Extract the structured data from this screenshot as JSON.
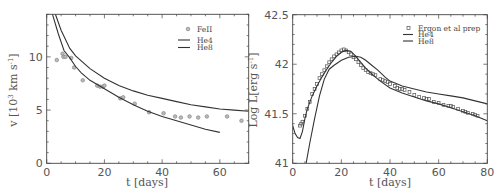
{
  "chart_data": [
    {
      "type": "line",
      "panel": "left",
      "title": "",
      "xlabel": "t [days]",
      "ylabel": "v [10^3 km s^-1]",
      "xlim": [
        0,
        70
      ],
      "ylim": [
        0,
        14
      ],
      "xticks": [
        0,
        20,
        40,
        60
      ],
      "yticks": [
        0,
        5,
        10
      ],
      "grid": false,
      "legend_position": "upper right",
      "legend": [
        "FeII",
        "He4",
        "He8"
      ],
      "series": [
        {
          "name": "FeII",
          "kind": "scatter",
          "x": [
            3.5,
            5.5,
            5.8,
            6.5,
            8.5,
            9.5,
            12.5,
            17.5,
            18.5,
            19.5,
            20,
            25.5,
            26.5,
            30.5,
            35.5,
            40.5,
            44.5,
            46.5,
            49.5,
            52.5,
            55.5,
            62.5,
            67.5
          ],
          "y": [
            9.7,
            10.3,
            10.0,
            10.0,
            9.9,
            9.0,
            7.8,
            7.3,
            7.2,
            7.2,
            7.3,
            6.1,
            6.2,
            5.6,
            4.8,
            4.7,
            4.4,
            4.3,
            4.4,
            4.3,
            4.4,
            4.4,
            4.0
          ]
        },
        {
          "name": "He4",
          "kind": "line",
          "x": [
            2,
            4,
            6,
            8,
            10,
            12,
            15,
            20,
            25,
            30,
            35,
            40,
            45,
            50,
            55,
            60
          ],
          "y": [
            14,
            12.2,
            10.6,
            9.9,
            9.1,
            8.5,
            7.8,
            7.0,
            6.2,
            5.5,
            4.9,
            4.4,
            4.0,
            3.6,
            3.2,
            2.9
          ]
        },
        {
          "name": "He8",
          "kind": "line",
          "x": [
            3,
            5,
            8,
            10,
            15,
            20,
            25,
            30,
            35,
            40,
            45,
            50,
            55,
            60,
            65,
            70
          ],
          "y": [
            14,
            12.5,
            10.8,
            10.1,
            8.9,
            8.0,
            7.3,
            6.8,
            6.4,
            6.1,
            5.8,
            5.5,
            5.3,
            5.1,
            5.0,
            4.9
          ]
        }
      ]
    },
    {
      "type": "line",
      "panel": "right",
      "title": "",
      "xlabel": "t [days]",
      "ylabel": "Log L[erg s^-1]",
      "xlim": [
        0,
        80
      ],
      "ylim": [
        41,
        42.5
      ],
      "xticks": [
        0,
        20,
        40,
        60,
        80
      ],
      "yticks": [
        41,
        41.5,
        42,
        42.5
      ],
      "grid": false,
      "legend_position": "upper right",
      "legend": [
        "Ergon et al prep",
        "He4",
        "He8"
      ],
      "series": [
        {
          "name": "Ergon et al prep",
          "kind": "scatter",
          "x": [
            3,
            3.5,
            4,
            5,
            6,
            7,
            8,
            9,
            10,
            11,
            12,
            13,
            14,
            15,
            16,
            17,
            18,
            19,
            20,
            21,
            22,
            23,
            24,
            25,
            26,
            27,
            28,
            29,
            30,
            31,
            32,
            33,
            34,
            36,
            37,
            38,
            39,
            40,
            42,
            43,
            44,
            45,
            46,
            48,
            50,
            52,
            54,
            55,
            56,
            58,
            60,
            62,
            64,
            65,
            66,
            68,
            70,
            71,
            72,
            74,
            75,
            76
          ],
          "y": [
            41.38,
            41.4,
            41.42,
            41.48,
            41.55,
            41.62,
            41.7,
            41.75,
            41.8,
            41.86,
            41.9,
            41.94,
            41.98,
            42.02,
            42.05,
            42.08,
            42.1,
            42.12,
            42.14,
            42.15,
            42.14,
            42.12,
            42.1,
            42.07,
            42.05,
            42.02,
            41.99,
            41.96,
            41.94,
            41.92,
            41.91,
            41.9,
            41.89,
            41.85,
            41.84,
            41.83,
            41.82,
            41.8,
            41.78,
            41.76,
            41.75,
            41.75,
            41.74,
            41.72,
            41.69,
            41.67,
            41.66,
            41.65,
            41.65,
            41.62,
            41.61,
            41.59,
            41.58,
            41.58,
            41.57,
            41.55,
            41.53,
            41.52,
            41.51,
            41.5,
            41.49,
            41.48
          ]
        },
        {
          "name": "He4",
          "kind": "line",
          "x": [
            0,
            1,
            2,
            3,
            4,
            5,
            6,
            8,
            10,
            12,
            14,
            16,
            18,
            20,
            22,
            24,
            26,
            28,
            30,
            33,
            36,
            40,
            45,
            50,
            55,
            60,
            65,
            70,
            75,
            80
          ],
          "y": [
            41.38,
            41.3,
            41.26,
            41.25,
            41.32,
            41.45,
            41.55,
            41.68,
            41.78,
            41.87,
            41.95,
            42.02,
            42.08,
            42.12,
            42.14,
            42.13,
            42.08,
            42.02,
            41.96,
            41.89,
            41.83,
            41.76,
            41.71,
            41.67,
            41.63,
            41.6,
            41.56,
            41.52,
            41.48,
            41.43
          ]
        },
        {
          "name": "He8",
          "kind": "line",
          "x": [
            5.5,
            7,
            9,
            11,
            13,
            15,
            17,
            20,
            23,
            26,
            28,
            30,
            32,
            35,
            38,
            40,
            45,
            50,
            55,
            60,
            65,
            70,
            75,
            80
          ],
          "y": [
            41.0,
            41.2,
            41.45,
            41.68,
            41.85,
            41.95,
            41.99,
            42.04,
            42.07,
            42.08,
            42.07,
            42.04,
            42.0,
            41.94,
            41.87,
            41.83,
            41.78,
            41.75,
            41.72,
            41.7,
            41.68,
            41.66,
            41.63,
            41.6
          ]
        }
      ]
    }
  ],
  "left_panel": {
    "xlabel": "t [days]",
    "ylabel_main": "v [10",
    "ylabel_sup": "3",
    "ylabel_rest": " km s",
    "ylabel_sup2": "-1",
    "ylabel_end": "]",
    "xtick_labels": [
      "0",
      "20",
      "40",
      "60"
    ],
    "ytick_labels": [
      "0",
      "5",
      "10"
    ],
    "legend": {
      "points": "FeII",
      "line1": "He4",
      "line2": "He8"
    }
  },
  "right_panel": {
    "xlabel": "t [days]",
    "ylabel_main": "Log L[erg s",
    "ylabel_sup": "-1",
    "ylabel_end": "]",
    "xtick_labels": [
      "0",
      "20",
      "40",
      "60",
      "80"
    ],
    "ytick_labels": [
      "41",
      "41.5",
      "42",
      "42.5"
    ],
    "legend": {
      "points": "Ergon et al prep",
      "line1": "He4",
      "line2": "He8"
    }
  }
}
